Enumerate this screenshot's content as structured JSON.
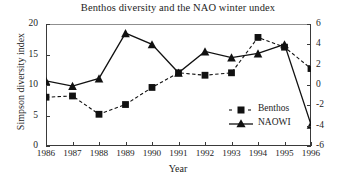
{
  "chart_data": {
    "type": "line",
    "title": "Benthos diversity and the NAO winter undex",
    "xlabel": "Year",
    "ylabel": "Simpson diversity index",
    "y2label": "",
    "categories": [
      "1986",
      "1987",
      "1988",
      "1989",
      "1990",
      "1991",
      "1992",
      "1993",
      "1994",
      "1995",
      "1996"
    ],
    "x": [
      1986,
      1987,
      1988,
      1989,
      1990,
      1991,
      1992,
      1993,
      1994,
      1995,
      1996
    ],
    "ylim": [
      0,
      20
    ],
    "yticks": [
      0,
      5,
      10,
      15,
      20
    ],
    "y2lim": [
      -6,
      6
    ],
    "y2ticks": [
      6,
      4,
      2,
      0,
      -2,
      -4,
      -6
    ],
    "grid": false,
    "legend_position": "inside-lower-right",
    "series": [
      {
        "name": "Benthos",
        "axis": "left",
        "marker": "square",
        "linestyle": "dashed",
        "color": "#111111",
        "values": [
          8.0,
          8.2,
          5.2,
          6.8,
          9.6,
          12.0,
          11.6,
          12.0,
          17.8,
          16.2,
          12.7
        ]
      },
      {
        "name": "NAOWI",
        "axis": "right",
        "marker": "triangle",
        "linestyle": "solid",
        "color": "#111111",
        "values": [
          0.4,
          -0.1,
          0.65,
          5.1,
          4.0,
          1.2,
          3.3,
          2.7,
          3.1,
          4.0,
          -3.9
        ]
      }
    ]
  },
  "legend": {
    "items": [
      {
        "label": "Benthos"
      },
      {
        "label": "NAOWI"
      }
    ]
  },
  "axis_left": {
    "ticks": [
      "20",
      "15",
      "10",
      "5",
      "0"
    ]
  },
  "axis_right": {
    "ticks": [
      "6",
      "4",
      "2",
      "0",
      "-2",
      "-4",
      "-6"
    ]
  }
}
